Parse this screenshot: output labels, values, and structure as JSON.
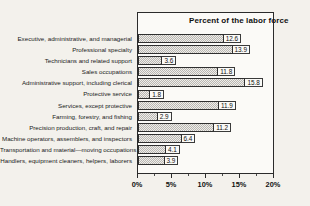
{
  "chart_data": {
    "type": "bar",
    "orientation": "horizontal",
    "title": "Percent of the labor force",
    "xlabel": "",
    "ylabel": "",
    "xlim": [
      0,
      20
    ],
    "grid": false,
    "legend": null,
    "xtick_labels": [
      "0%",
      "5%",
      "10%",
      "15%",
      "20%"
    ],
    "xtick_values": [
      0,
      5,
      10,
      15,
      20
    ],
    "xtick_minor_values": [
      2.5,
      7.5,
      12.5,
      17.5
    ],
    "categories": [
      "Executive, administrative, and managerial",
      "Professional specialty",
      "Technicians and related support",
      "Sales occupations",
      "Administrative support, including clerical",
      "Protective service",
      "Services, except protective",
      "Farming, forestry, and fishing",
      "Precision production, craft, and repair",
      "Machine operators, assemblers, and inspectors",
      "Transportation and material—moving occupations",
      "Handlers, equipment cleaners, helpers, laborers"
    ],
    "values": [
      12.6,
      13.9,
      3.6,
      11.8,
      15.8,
      1.8,
      11.9,
      2.9,
      11.2,
      6.4,
      4.1,
      3.9
    ],
    "value_labels": [
      "12.6",
      "13.9",
      "3.6",
      "11.8",
      "15.8",
      "1.8",
      "11.9",
      "2.9",
      "11.2",
      "6.4",
      "4.1",
      "3.9"
    ],
    "colors": {
      "background": "#f3f1ec",
      "plot_background": "#fbfaf7",
      "bar_fill": "#d2d0cc",
      "bar_edge": "#2f2f2f",
      "axis": "#2b2b2b",
      "text": "#111111"
    }
  }
}
